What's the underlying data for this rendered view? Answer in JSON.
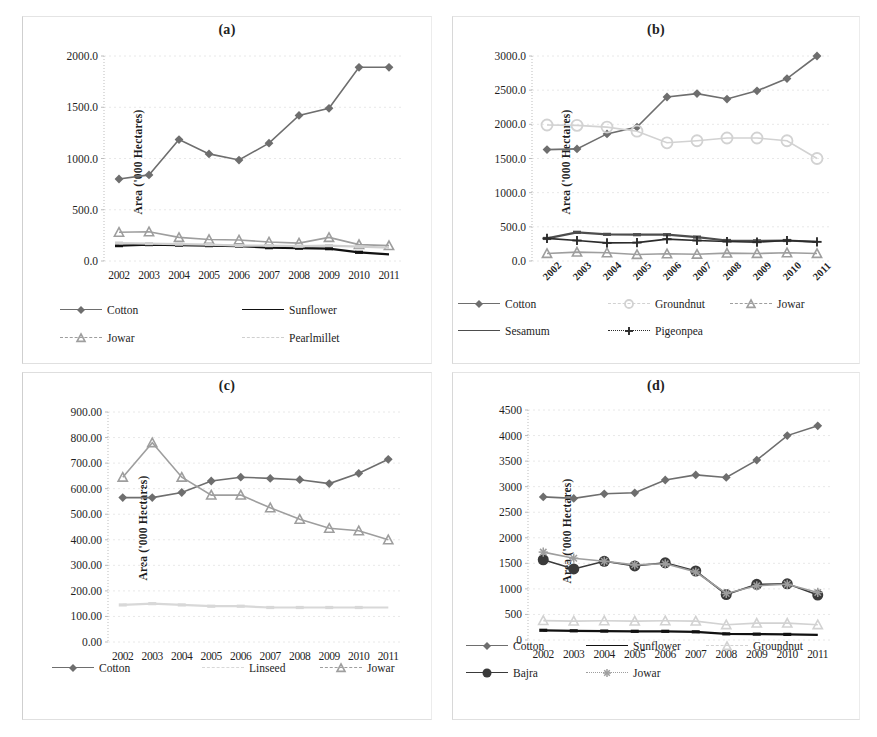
{
  "figure": {
    "panels": [
      "(a)",
      "(b)",
      "(c)",
      "(d)"
    ],
    "y_axis_label": "Area ('000 Hectares)",
    "years": [
      "2002",
      "2003",
      "2004",
      "2005",
      "2006",
      "2007",
      "2008",
      "2009",
      "2010",
      "2011"
    ]
  },
  "colors": {
    "cotton": "#6e6e6e",
    "sunflower": "#111111",
    "jowar": "#9e9e9e",
    "pearlmillet": "#cfcfcf",
    "groundnut": "#d2d2d2",
    "sesamum": "#4d4d4d",
    "pigeonpea": "#2b2b2b",
    "linseed": "#d8d8d8",
    "bajra": "#3a3a3a",
    "grid": "#e8e8e8",
    "axis": "#bdbdbd",
    "text": "#1f1f1f"
  },
  "chart_data": [
    {
      "id": "a",
      "type": "line",
      "title": "(a)",
      "xlabel": "",
      "ylabel": "Area ('000 Hectares)",
      "categories": [
        "2002",
        "2003",
        "2004",
        "2005",
        "2006",
        "2007",
        "2008",
        "2009",
        "2010",
        "2011"
      ],
      "yticks": [
        "0.0",
        "500.0",
        "1000.0",
        "1500.0",
        "2000.0"
      ],
      "ylim": [
        0,
        2000
      ],
      "grid": true,
      "legend_position": "bottom",
      "xtick_rotation": 0,
      "series": [
        {
          "name": "Cotton",
          "marker": "diamond",
          "values": [
            800,
            840,
            1185,
            1045,
            985,
            1150,
            1420,
            1490,
            1890,
            1890
          ]
        },
        {
          "name": "Sunflower",
          "marker": "none",
          "values": [
            150,
            160,
            155,
            150,
            145,
            130,
            125,
            120,
            85,
            65
          ]
        },
        {
          "name": "Jowar",
          "marker": "triangle",
          "values": [
            280,
            285,
            230,
            210,
            205,
            185,
            175,
            230,
            160,
            150
          ]
        },
        {
          "name": "Pearlmillet",
          "marker": "none",
          "values": [
            175,
            170,
            165,
            160,
            150,
            150,
            145,
            150,
            140,
            130
          ]
        }
      ]
    },
    {
      "id": "b",
      "type": "line",
      "title": "(b)",
      "xlabel": "",
      "ylabel": "Area ('000 Hectares)",
      "categories": [
        "2002",
        "2003",
        "2004",
        "2005",
        "2006",
        "2007",
        "2008",
        "2009",
        "2010",
        "2011"
      ],
      "yticks": [
        "0.0",
        "500.0",
        "1000.0",
        "1500.0",
        "2000.0",
        "2500.0",
        "3000.0"
      ],
      "ylim": [
        0,
        3000
      ],
      "grid": true,
      "legend_position": "bottom",
      "xtick_rotation": 45,
      "series": [
        {
          "name": "Cotton",
          "marker": "diamond",
          "values": [
            1630,
            1640,
            1860,
            1960,
            2400,
            2450,
            2370,
            2490,
            2670,
            3000
          ]
        },
        {
          "name": "Groundnut",
          "marker": "circle",
          "values": [
            1990,
            1985,
            1960,
            1900,
            1730,
            1760,
            1800,
            1800,
            1760,
            1500
          ]
        },
        {
          "name": "Jowar",
          "marker": "triangle",
          "values": [
            110,
            130,
            120,
            95,
            105,
            100,
            115,
            110,
            120,
            110
          ]
        },
        {
          "name": "Sesamum",
          "marker": "none",
          "values": [
            330,
            420,
            390,
            385,
            385,
            350,
            300,
            295,
            300,
            280
          ]
        },
        {
          "name": "Pigeonpea",
          "marker": "plus",
          "values": [
            330,
            300,
            265,
            270,
            320,
            300,
            285,
            275,
            300,
            280
          ]
        }
      ]
    },
    {
      "id": "c",
      "type": "line",
      "title": "(c)",
      "xlabel": "",
      "ylabel": "Area ('000 Hectares)",
      "categories": [
        "2002",
        "2003",
        "2004",
        "2005",
        "2006",
        "2007",
        "2008",
        "2009",
        "2010",
        "2011"
      ],
      "yticks": [
        "0.00",
        "100.00",
        "200.00",
        "300.00",
        "400.00",
        "500.00",
        "600.00",
        "700.00",
        "800.00",
        "900.00"
      ],
      "ylim": [
        0,
        900
      ],
      "grid": true,
      "legend_position": "bottom",
      "xtick_rotation": 0,
      "series": [
        {
          "name": "Cotton",
          "marker": "diamond",
          "values": [
            565,
            565,
            585,
            630,
            645,
            640,
            635,
            620,
            660,
            715
          ]
        },
        {
          "name": "Linseed",
          "marker": "none",
          "values": [
            145,
            150,
            145,
            140,
            140,
            135,
            135,
            135,
            135,
            135
          ]
        },
        {
          "name": "Jowar",
          "marker": "triangle",
          "values": [
            645,
            780,
            645,
            575,
            575,
            525,
            480,
            445,
            435,
            400
          ]
        }
      ]
    },
    {
      "id": "d",
      "type": "line",
      "title": "(d)",
      "xlabel": "",
      "ylabel": "Area ('000 Hectares)",
      "categories": [
        "2002",
        "2003",
        "2004",
        "2005",
        "2006",
        "2007",
        "2008",
        "2009",
        "2010",
        "2011"
      ],
      "yticks": [
        "0",
        "500",
        "1000",
        "1500",
        "2000",
        "2500",
        "3000",
        "3500",
        "4000",
        "4500"
      ],
      "ylim": [
        0,
        4500
      ],
      "grid": true,
      "legend_position": "bottom",
      "xtick_rotation": 0,
      "series": [
        {
          "name": "Cotton",
          "marker": "diamond",
          "values": [
            2800,
            2770,
            2860,
            2880,
            3130,
            3230,
            3180,
            3520,
            4000,
            4190
          ]
        },
        {
          "name": "Sunflower",
          "marker": "none",
          "values": [
            190,
            180,
            175,
            170,
            170,
            160,
            120,
            115,
            110,
            100
          ]
        },
        {
          "name": "Groundnut",
          "marker": "triangle",
          "values": [
            380,
            370,
            375,
            370,
            375,
            370,
            300,
            330,
            330,
            300
          ]
        },
        {
          "name": "Bajra",
          "marker": "circle-filled",
          "values": [
            1570,
            1390,
            1540,
            1450,
            1510,
            1350,
            890,
            1090,
            1100,
            880
          ]
        },
        {
          "name": "Jowar",
          "marker": "star",
          "values": [
            1720,
            1600,
            1540,
            1470,
            1490,
            1330,
            910,
            1060,
            1090,
            930
          ]
        }
      ]
    }
  ],
  "panels": [
    {
      "id": "a",
      "title": "(a)",
      "ylabel": "Area ('000 Hectares)",
      "legend": [
        [
          {
            "label": "Cotton",
            "key": "cotton"
          },
          {
            "label": "Sunflower",
            "key": "sunflower"
          }
        ],
        [
          {
            "label": "Jowar",
            "key": "jowar"
          },
          {
            "label": "Pearlmillet",
            "key": "pearlmillet"
          }
        ]
      ]
    },
    {
      "id": "b",
      "title": "(b)",
      "ylabel": "Area ('000 Hectares)",
      "legend": [
        [
          {
            "label": "Cotton",
            "key": "cotton"
          },
          {
            "label": "Groundnut",
            "key": "groundnut"
          },
          {
            "label": "Jowar",
            "key": "jowar"
          }
        ],
        [
          {
            "label": "Sesamum",
            "key": "sesamum"
          },
          {
            "label": "Pigeonpea",
            "key": "pigeonpea"
          }
        ]
      ]
    },
    {
      "id": "c",
      "title": "(c)",
      "ylabel": "Area ('000 Hectares)",
      "legend": [
        [
          {
            "label": "Cotton",
            "key": "cotton"
          },
          {
            "label": "Linseed",
            "key": "linseed"
          },
          {
            "label": "Jowar",
            "key": "jowar"
          }
        ]
      ]
    },
    {
      "id": "d",
      "title": "(d)",
      "ylabel": "Area ('000 Hectares)",
      "legend": [
        [
          {
            "label": "Cotton",
            "key": "cotton"
          },
          {
            "label": "Sunflower",
            "key": "sunflower"
          },
          {
            "label": "Groundnut",
            "key": "groundnut"
          }
        ],
        [
          {
            "label": "Bajra",
            "key": "bajra"
          },
          {
            "label": "Jowar",
            "key": "jowar"
          }
        ]
      ]
    }
  ]
}
